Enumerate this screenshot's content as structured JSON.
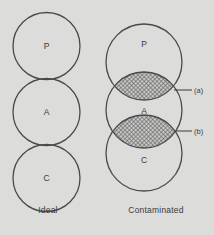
{
  "figure": {
    "background_color": "#dcdcda",
    "stroke_color": "#4a4a4a",
    "hatch_color": "#5a5a5a",
    "text_color": "#3a3a3a"
  },
  "panels": [
    {
      "id": "ideal",
      "caption": "Ideal",
      "circles": [
        {
          "label": "P",
          "cx": 46.5,
          "cy": 46,
          "r": 33.5
        },
        {
          "label": "A",
          "cx": 46.5,
          "cy": 112,
          "r": 33.5
        },
        {
          "label": "C",
          "cx": 46.5,
          "cy": 178,
          "r": 33.5
        }
      ],
      "overlaps": []
    },
    {
      "id": "contaminated",
      "caption": "Contaminated",
      "circles": [
        {
          "label": "P",
          "cx": 144,
          "cy": 62,
          "r": 38
        },
        {
          "label": "A",
          "cx": 144,
          "cy": 110,
          "r": 38
        },
        {
          "label": "C",
          "cx": 144,
          "cy": 153,
          "r": 38
        }
      ],
      "overlaps": [
        {
          "id": "a",
          "label": "(a)",
          "between": "P-A",
          "cy": 90,
          "rx": 30,
          "ry": 12
        },
        {
          "id": "b",
          "label": "(b)",
          "between": "A-C",
          "cy": 131,
          "rx": 30,
          "ry": 12
        }
      ]
    }
  ],
  "annotations": [
    {
      "id": "a",
      "label": "(a)",
      "leader_from_x": 174,
      "leader_to_x": 192,
      "leader_y": 90,
      "label_x": 194,
      "label_y": 90
    },
    {
      "id": "b",
      "label": "(b)",
      "leader_from_x": 174,
      "leader_to_x": 192,
      "leader_y": 131,
      "label_x": 194,
      "label_y": 131
    }
  ]
}
